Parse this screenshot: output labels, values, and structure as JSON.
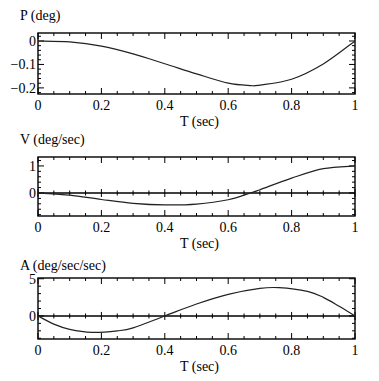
{
  "chart_data": [
    {
      "type": "line",
      "title": "",
      "ylabel": "P (deg)",
      "xlabel": "T (sec)",
      "xlim": [
        0,
        1
      ],
      "ylim": [
        -0.226,
        0.034
      ],
      "x_ticks": [
        "0",
        "0.2",
        "0.4",
        "0.6",
        "0.8",
        "1"
      ],
      "y_ticks": [
        {
          "value": 0,
          "label": "0"
        },
        {
          "value": -0.1,
          "label": "−0.1"
        },
        {
          "value": -0.2,
          "label": "−0.2"
        }
      ],
      "zero_line": false,
      "series": [
        {
          "name": "P",
          "x": [
            0,
            0.1,
            0.2,
            0.3,
            0.4,
            0.5,
            0.6,
            0.67,
            0.7,
            0.8,
            0.9,
            1.0
          ],
          "y": [
            0,
            -0.004,
            -0.022,
            -0.055,
            -0.097,
            -0.14,
            -0.18,
            -0.19,
            -0.188,
            -0.163,
            -0.098,
            0
          ]
        }
      ]
    },
    {
      "type": "line",
      "title": "",
      "ylabel": "V (deg/sec)",
      "xlabel": "T (sec)",
      "xlim": [
        0,
        1
      ],
      "ylim": [
        -0.85,
        1.33
      ],
      "x_ticks": [
        "0",
        "0.2",
        "0.4",
        "0.6",
        "0.8",
        "1"
      ],
      "y_ticks": [
        {
          "value": 1,
          "label": "1"
        },
        {
          "value": 0,
          "label": "0"
        }
      ],
      "zero_line": true,
      "series": [
        {
          "name": "V",
          "x": [
            0,
            0.1,
            0.2,
            0.3,
            0.4,
            0.5,
            0.6,
            0.67,
            0.7,
            0.8,
            0.9,
            1.0
          ],
          "y": [
            0,
            -0.08,
            -0.24,
            -0.38,
            -0.44,
            -0.41,
            -0.25,
            0,
            0.12,
            0.55,
            0.9,
            1.0
          ]
        }
      ]
    },
    {
      "type": "line",
      "title": "",
      "ylabel": "A (deg/sec/sec)",
      "xlabel": "T (sec)",
      "xlim": [
        0,
        1
      ],
      "ylim": [
        -3.1,
        5.1
      ],
      "x_ticks": [
        "0",
        "0.2",
        "0.4",
        "0.6",
        "0.8",
        "1"
      ],
      "y_ticks": [
        {
          "value": 5,
          "label": "5"
        },
        {
          "value": 0,
          "label": "0"
        }
      ],
      "zero_line": true,
      "series": [
        {
          "name": "A",
          "x": [
            0,
            0.05,
            0.1,
            0.17,
            0.25,
            0.3,
            0.4,
            0.5,
            0.6,
            0.7,
            0.76,
            0.85,
            0.9,
            0.95,
            1.0
          ],
          "y": [
            0,
            -1.1,
            -1.8,
            -2.2,
            -2.0,
            -1.6,
            0,
            1.6,
            2.9,
            3.7,
            3.8,
            3.3,
            2.5,
            1.3,
            0
          ]
        }
      ]
    }
  ]
}
